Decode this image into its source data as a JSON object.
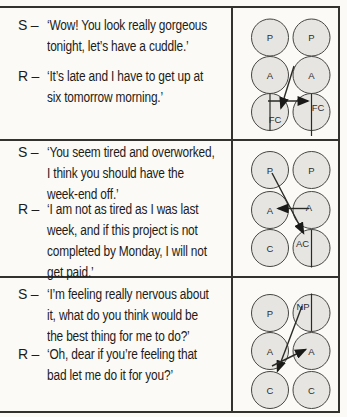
{
  "figure": {
    "rows": [
      {
        "stimulus": {
          "label": "S –",
          "lines": [
            "‘Wow! You look really gorgeous",
            "tonight, let’s have a cuddle.’"
          ]
        },
        "response": {
          "label": "R –",
          "lines": [
            "‘It’s late and I have to get up at",
            "six tomorrow morning.’"
          ]
        },
        "diagram": {
          "left": [
            "P",
            "A",
            "FC"
          ],
          "right": [
            "P",
            "A",
            "FC"
          ],
          "stimulus_arrow": "left-FC to right-FC",
          "response_arrow": "right-A to left-FC"
        }
      },
      {
        "stimulus": {
          "label": "S –",
          "lines": [
            "‘You seem tired and overworked,",
            "I think you should have the",
            "week-end off.’"
          ]
        },
        "response": {
          "label": "R –",
          "lines": [
            "‘I am not as tired as I was last",
            "week, and if this project is not",
            "completed by Monday, I will not",
            "get paid.’"
          ]
        },
        "diagram": {
          "left": [
            "P",
            "A",
            "C"
          ],
          "right": [
            "P",
            "A",
            "AC"
          ],
          "stimulus_arrow": "left-P to right-AC",
          "response_arrow": "right-A to left-A"
        }
      },
      {
        "stimulus": {
          "label": "S –",
          "lines": [
            "‘I’m feeling really nervous about",
            "it, what do you think would be",
            "the best thing for me to do?’"
          ]
        },
        "response": {
          "label": "R –",
          "lines": [
            "‘Oh, dear if you’re feeling that",
            "bad let me do it for you?’"
          ]
        },
        "diagram": {
          "left": [
            "P",
            "A",
            "C"
          ],
          "right": [
            "NP",
            "A",
            "C"
          ],
          "stimulus_arrow": "left-C to right-A",
          "response_arrow": "right-NP to left-C"
        }
      }
    ],
    "colors": {
      "background": "#fbfaf6",
      "circle_fill": "#e6e5e2",
      "line": "#33322f"
    }
  }
}
